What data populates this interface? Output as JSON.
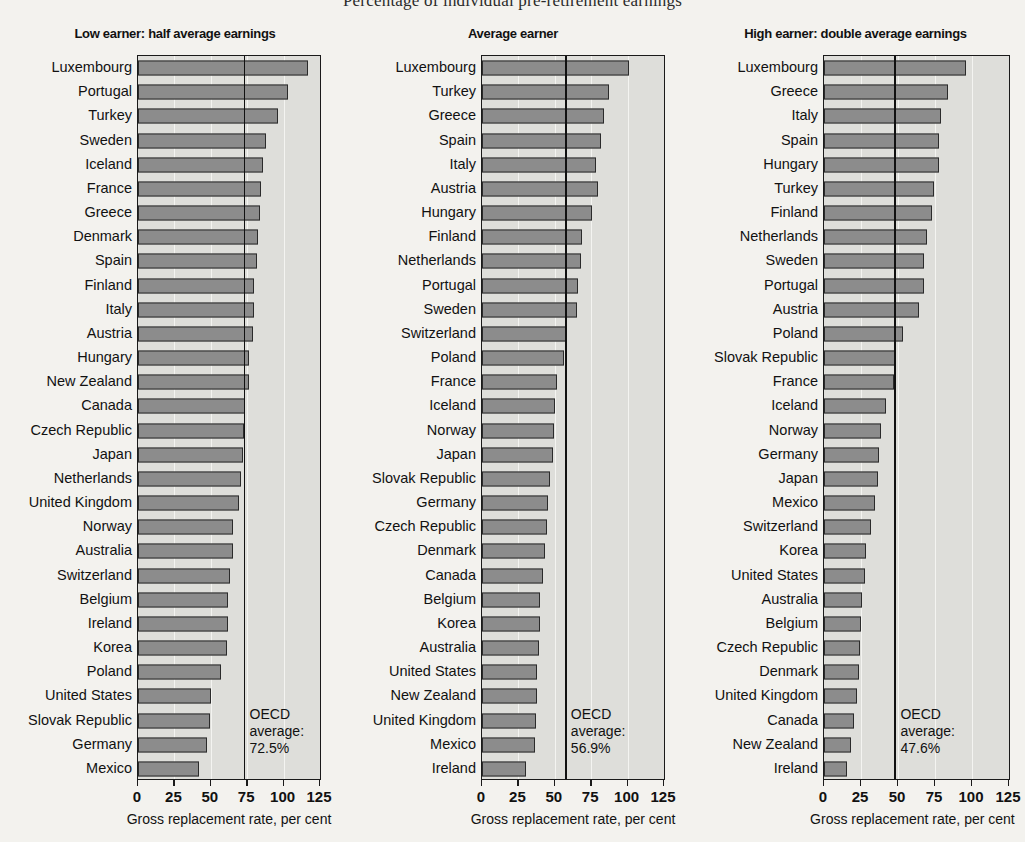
{
  "main_title": "Percentage of individual pre-retirement earnings",
  "axis_title": "Gross replacement rate, per cent",
  "oecd_label_line1": "OECD",
  "oecd_label_line2": "average:",
  "colors": {
    "bar_fill": "#8c8c8c",
    "bar_edge": "#2b2b2b",
    "plot_background": "#dededa",
    "page_background": "#f3f2ee",
    "average_line": "#111111"
  },
  "chart_data": [
    {
      "type": "bar",
      "orientation": "horizontal",
      "title": "Low earner: half average earnings",
      "xlabel": "Gross replacement rate, per cent",
      "ylabel": "",
      "xlim": [
        0,
        125
      ],
      "xticks": [
        0,
        25,
        50,
        75,
        100,
        125
      ],
      "grid": true,
      "grid_axis": "x",
      "annotation": "OECD average: 72.5%",
      "reference_line": 72.5,
      "categories": [
        "Luxembourg",
        "Portugal",
        "Turkey",
        "Sweden",
        "Iceland",
        "France",
        "Greece",
        "Denmark",
        "Spain",
        "Finland",
        "Italy",
        "Austria",
        "Hungary",
        "New Zealand",
        "Canada",
        "Czech Republic",
        "Japan",
        "Netherlands",
        "United Kingdom",
        "Norway",
        "Australia",
        "Switzerland",
        "Belgium",
        "Ireland",
        "Korea",
        "Poland",
        "United States",
        "Slovak Republic",
        "Germany",
        "Mexico"
      ],
      "values": [
        116.7,
        103.0,
        96.0,
        88.0,
        86.0,
        84.5,
        84.0,
        82.5,
        81.5,
        80.0,
        79.5,
        79.0,
        76.5,
        76.5,
        73.5,
        73.0,
        72.0,
        70.5,
        69.5,
        65.5,
        65.0,
        63.0,
        62.0,
        62.0,
        61.0,
        57.0,
        50.0,
        49.5,
        47.5,
        42.0
      ]
    },
    {
      "type": "bar",
      "orientation": "horizontal",
      "title": "Average earner",
      "xlabel": "Gross replacement rate, per cent",
      "ylabel": "",
      "xlim": [
        0,
        125
      ],
      "xticks": [
        0,
        25,
        50,
        75,
        100,
        125
      ],
      "grid": true,
      "grid_axis": "x",
      "annotation": "OECD average: 56.9%",
      "reference_line": 56.9,
      "categories": [
        "Luxembourg",
        "Turkey",
        "Greece",
        "Spain",
        "Italy",
        "Austria",
        "Hungary",
        "Finland",
        "Netherlands",
        "Portugal",
        "Sweden",
        "Switzerland",
        "Poland",
        "France",
        "Iceland",
        "Norway",
        "Japan",
        "Slovak Republic",
        "Germany",
        "Czech Republic",
        "Denmark",
        "Canada",
        "Belgium",
        "Korea",
        "Australia",
        "United States",
        "New Zealand",
        "United Kingdom",
        "Mexico",
        "Ireland"
      ],
      "values": [
        101.0,
        87.5,
        84.0,
        81.5,
        78.5,
        80.0,
        75.5,
        68.5,
        68.0,
        66.0,
        65.5,
        57.5,
        56.5,
        51.5,
        50.0,
        49.5,
        48.5,
        47.0,
        45.5,
        44.5,
        43.5,
        42.0,
        40.0,
        39.5,
        39.0,
        38.0,
        37.5,
        37.0,
        36.5,
        30.5
      ]
    },
    {
      "type": "bar",
      "orientation": "horizontal",
      "title": "High earner: double average earnings",
      "xlabel": "Gross replacement rate, per cent",
      "ylabel": "",
      "xlim": [
        0,
        125
      ],
      "xticks": [
        0,
        25,
        50,
        75,
        100,
        125
      ],
      "grid": true,
      "grid_axis": "x",
      "annotation": "OECD average: 47.6%",
      "reference_line": 47.6,
      "categories": [
        "Luxembourg",
        "Greece",
        "Italy",
        "Spain",
        "Hungary",
        "Turkey",
        "Finland",
        "Netherlands",
        "Sweden",
        "Portugal",
        "Austria",
        "Poland",
        "Slovak Republic",
        "France",
        "Iceland",
        "Norway",
        "Germany",
        "Japan",
        "Mexico",
        "Switzerland",
        "Korea",
        "United States",
        "Australia",
        "Belgium",
        "Czech Republic",
        "Denmark",
        "United Kingdom",
        "Canada",
        "New Zealand",
        "Ireland"
      ],
      "values": [
        96.0,
        84.0,
        79.0,
        78.0,
        77.5,
        74.5,
        73.0,
        69.5,
        67.5,
        67.5,
        64.5,
        53.5,
        48.0,
        47.0,
        42.0,
        38.5,
        37.0,
        36.5,
        34.5,
        32.0,
        28.5,
        27.5,
        25.5,
        25.0,
        24.5,
        23.5,
        22.0,
        20.0,
        18.5,
        15.5
      ]
    }
  ]
}
